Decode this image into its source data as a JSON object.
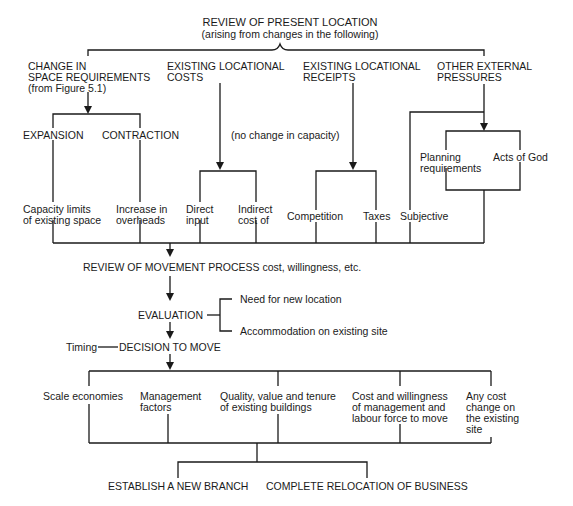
{
  "title": {
    "main": "REVIEW OF PRESENT LOCATION",
    "subtitle": "(arising from changes in the following)"
  },
  "categories": {
    "space": "CHANGE IN\nSPACE REQUIREMENTS\n(from Figure 5.1)",
    "costs": "EXISTING LOCATIONAL\nCOSTS",
    "receipts": "EXISTING LOCATIONAL\nRECEIPTS",
    "pressures": "OTHER EXTERNAL\nPRESSURES"
  },
  "space_branches": {
    "expansion": "EXPANSION",
    "contraction": "CONTRACTION",
    "capacity_limits": "Capacity limits\nof existing space",
    "overheads": "Increase in\noverheads"
  },
  "costs_branches": {
    "note": "(no change in capacity)",
    "direct": "Direct\ninput",
    "indirect": "Indirect\ncost of"
  },
  "receipts_branches": {
    "competition": "Competition",
    "taxes": "Taxes"
  },
  "subjective": "Subjective",
  "pressures_branches": {
    "planning": "Planning\nrequirements",
    "acts_of_god": "Acts of God"
  },
  "process": {
    "review_movement": "REVIEW OF MOVEMENT PROCESS cost, willingness, etc.",
    "evaluation": "EVALUATION",
    "eval_need": "Need for new location",
    "eval_accommodation": "Accommodation on existing site",
    "timing": "Timing",
    "decision": "DECISION TO MOVE"
  },
  "factors": {
    "scale": "Scale economies",
    "management": "Management\nfactors",
    "quality": "Quality, value and tenure\nof existing buildings",
    "cost_willingness": "Cost and willingness\nof management and\nlabour force to move",
    "cost_change": "Any cost\nchange on\nthe existing\nsite"
  },
  "outcomes": {
    "new_branch": "ESTABLISH A NEW BRANCH",
    "relocation": "COMPLETE RELOCATION OF BUSINESS"
  }
}
